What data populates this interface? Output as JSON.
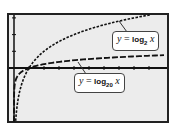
{
  "chart_data": {
    "type": "line",
    "title": "",
    "xlabel": "",
    "ylabel": "",
    "xlim": [
      -1,
      10
    ],
    "ylim": [
      -3.2,
      3.2
    ],
    "grid": false,
    "legend": "callout labels",
    "x_ticks": [
      1,
      2,
      3,
      4,
      5,
      6,
      7,
      8,
      9
    ],
    "y_ticks": [
      1,
      2,
      3
    ],
    "series": [
      {
        "name": "y = log2 x",
        "style": "dotted",
        "x": [
          0.14,
          0.25,
          0.5,
          1,
          2,
          3,
          4,
          5,
          6,
          7,
          8,
          9
        ],
        "values": [
          -2.84,
          -2.0,
          -1.0,
          0,
          1.0,
          1.58,
          2.0,
          2.32,
          2.58,
          2.81,
          3.0,
          3.17
        ]
      },
      {
        "name": "y = log20 x",
        "style": "dashed",
        "x": [
          0.01,
          0.05,
          0.25,
          0.5,
          1,
          2,
          4,
          6,
          8,
          10
        ],
        "values": [
          -1.54,
          -1.0,
          -0.46,
          -0.23,
          0,
          0.23,
          0.46,
          0.6,
          0.69,
          0.77
        ]
      }
    ]
  },
  "labels": {
    "log2": {
      "y": "y",
      "eq": "=",
      "fn": "log",
      "base": "2",
      "x": "x"
    },
    "log20": {
      "y": "y",
      "eq": "=",
      "fn": "log",
      "base": "20",
      "x": "x"
    }
  }
}
